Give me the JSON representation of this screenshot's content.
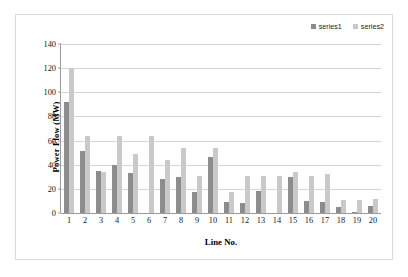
{
  "chart_data": {
    "type": "bar",
    "title": "",
    "xlabel": "Line No.",
    "ylabel": "Power Flow (MW)",
    "categories": [
      "1",
      "2",
      "3",
      "4",
      "5",
      "6",
      "7",
      "8",
      "9",
      "10",
      "11",
      "12",
      "13",
      "14",
      "15",
      "16",
      "17",
      "18",
      "19",
      "20"
    ],
    "series": [
      {
        "name": "series1",
        "color": "#8c8c8c",
        "values": [
          92,
          51,
          35,
          40,
          33,
          0,
          28,
          30,
          17,
          46,
          9,
          8,
          18,
          0,
          30,
          10,
          9,
          5,
          1,
          6
        ]
      },
      {
        "name": "series2",
        "color": "#c9c9c9",
        "values": [
          120,
          64,
          34,
          64,
          49,
          64,
          44,
          54,
          31,
          54,
          17,
          31,
          31,
          31,
          34,
          31,
          32,
          11,
          11,
          12
        ]
      }
    ],
    "ylim": [
      0,
      140
    ],
    "yticks": [
      0,
      20,
      40,
      60,
      80,
      100,
      120,
      140
    ],
    "ytick_labels": [
      "0",
      "20",
      "40",
      "60",
      "80",
      "100",
      "120",
      "140"
    ],
    "grid": "horizontal",
    "legend_position": "top-right",
    "legend_entries": [
      "series1",
      "series2"
    ]
  }
}
